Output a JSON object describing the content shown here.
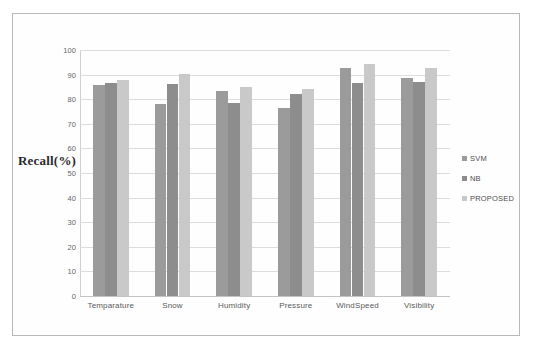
{
  "figure": {
    "background_color": "#fefefe",
    "border_color": "#b9b9b9"
  },
  "chart_data": {
    "type": "bar",
    "title": "",
    "subtitle": "",
    "xlabel": "",
    "ylabel": "Recall(%)",
    "categories": [
      "Temparature",
      "Snow",
      "Humidity",
      "Pressure",
      "WindSpeed",
      "Visibility"
    ],
    "series": [
      {
        "name": "SVM",
        "color": "#9b9b9b",
        "values": [
          85.7,
          78.0,
          83.2,
          76.4,
          92.5,
          88.8
        ]
      },
      {
        "name": "NB",
        "color": "#8d8d8d",
        "values": [
          86.7,
          86.0,
          78.3,
          82.3,
          86.5,
          87.0
        ]
      },
      {
        "name": "PROPOSED",
        "color": "#c9c9c9",
        "values": [
          87.8,
          90.2,
          85.0,
          84.3,
          94.5,
          92.5
        ]
      }
    ],
    "ylim": [
      0,
      100
    ],
    "ytick_step": 10,
    "yticks": [
      100,
      90,
      80,
      70,
      60,
      50,
      40,
      30,
      20,
      10,
      0
    ],
    "ytick_labels": [
      "100",
      "90",
      "80",
      "70",
      "60",
      "50",
      "40",
      "30",
      "20",
      "10",
      "0"
    ],
    "grid": true,
    "grid_axis": "y",
    "grid_color": "#dddddd",
    "legend_position": "right",
    "legend": [
      "SVM",
      "NB",
      "PROPOSED"
    ]
  }
}
